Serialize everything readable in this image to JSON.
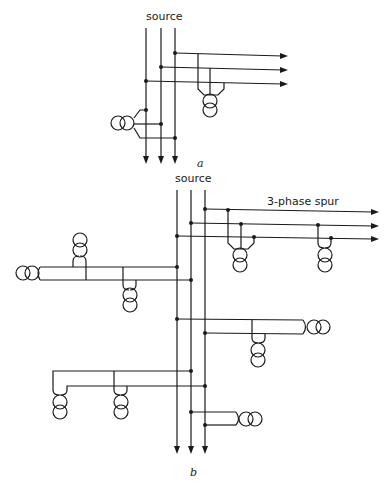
{
  "figure": {
    "panel_a": {
      "source_label": "source",
      "caption": "a"
    },
    "panel_b": {
      "source_label": "source",
      "spur_label": "3-phase spur",
      "caption": "b"
    }
  }
}
